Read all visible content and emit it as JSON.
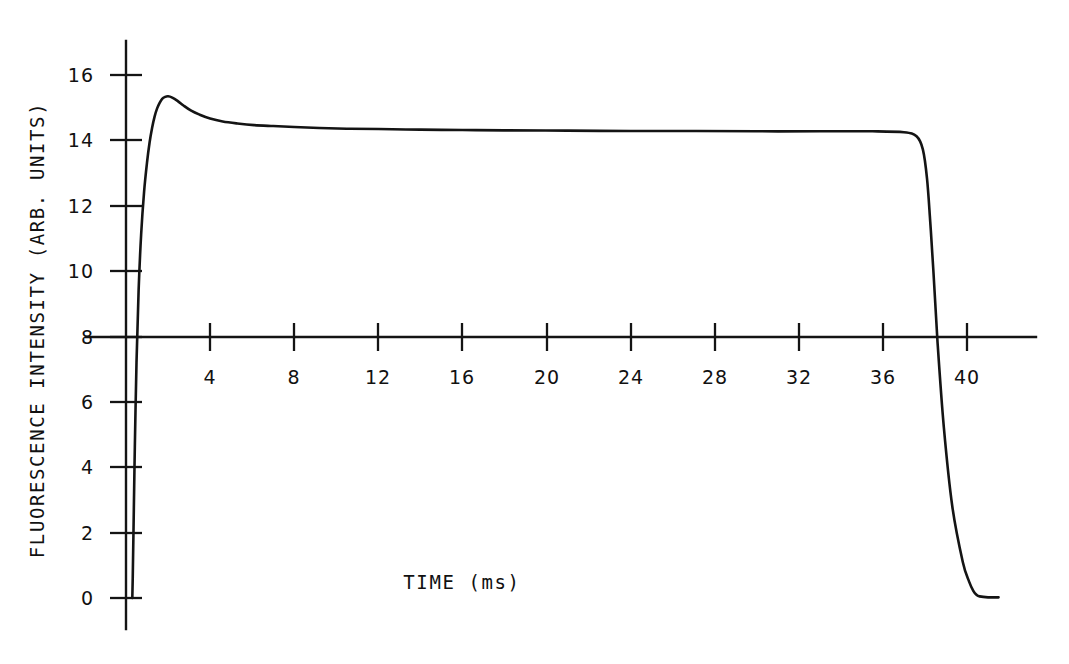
{
  "chart_data": {
    "type": "line",
    "title": "",
    "xlabel": "TIME (ms)",
    "ylabel": "FLUORESCENCE INTENSITY (ARB. UNITS)",
    "xlim": [
      0,
      43.3
    ],
    "ylim": [
      -0.9,
      16.9
    ],
    "xticks": [
      4,
      8,
      12,
      16,
      20,
      24,
      28,
      32,
      36,
      40
    ],
    "yticks": [
      0,
      2,
      4,
      6,
      8,
      10,
      12,
      14,
      16
    ],
    "xtick_labels": [
      "4",
      "8",
      "12",
      "16",
      "20",
      "24",
      "28",
      "32",
      "36",
      "40"
    ],
    "ytick_labels": [
      "0",
      "2",
      "4",
      "6",
      "8",
      "10",
      "12",
      "14",
      "16"
    ],
    "grid": false,
    "legend": null,
    "axis_style": "crossing-axes",
    "x_axis_crosses_y_at": 8,
    "y_axis_crosses_x_at": 0,
    "line_color": "#141414",
    "series": [
      {
        "name": "fluorescence",
        "x": [
          0.3,
          0.32,
          0.36,
          0.42,
          0.5,
          0.6,
          0.72,
          0.86,
          1.0,
          1.12,
          1.24,
          1.36,
          1.48,
          1.6,
          1.72,
          1.86,
          2.0,
          2.2,
          2.45,
          2.75,
          3.1,
          3.5,
          4.0,
          4.6,
          5.3,
          6.1,
          7.0,
          8.0,
          9.2,
          10.5,
          12.0,
          14.0,
          16.0,
          18.0,
          21.0,
          24.0,
          27.0,
          30.0,
          33.0,
          35.5,
          37.0,
          37.6,
          37.9,
          38.1,
          38.25,
          38.4,
          38.6,
          38.9,
          39.3,
          39.8,
          40.1,
          40.3,
          40.45,
          40.6,
          41.0,
          41.5
        ],
        "y": [
          0.0,
          0.6,
          2.2,
          4.6,
          7.2,
          9.4,
          11.1,
          12.4,
          13.3,
          13.9,
          14.35,
          14.7,
          14.95,
          15.12,
          15.24,
          15.3,
          15.32,
          15.28,
          15.18,
          15.03,
          14.88,
          14.76,
          14.64,
          14.55,
          14.49,
          14.44,
          14.41,
          14.38,
          14.35,
          14.33,
          14.32,
          14.3,
          14.29,
          14.28,
          14.27,
          14.26,
          14.26,
          14.25,
          14.25,
          14.25,
          14.22,
          14.1,
          13.7,
          12.8,
          11.5,
          10.0,
          7.8,
          5.2,
          2.8,
          1.1,
          0.5,
          0.22,
          0.1,
          0.05,
          0.02,
          0.02
        ],
        "peak_value": 15.32,
        "peak_time": 2.0,
        "plateau_value": 14.26,
        "baseline_value": 0.0,
        "rise_start_time": 0.3,
        "fall_time": 38.2,
        "end_time": 41.5
      }
    ]
  },
  "axes": {
    "y_label_text": "FLUORESCENCE INTENSITY (ARB. UNITS)",
    "x_label_text": "TIME (ms)"
  }
}
